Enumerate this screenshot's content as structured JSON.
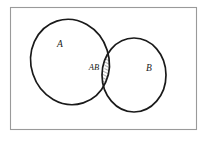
{
  "figure": {
    "name": "venn-diagram",
    "type": "venn-2-set",
    "background_color": "#ffffff",
    "frame": {
      "label": "universal-set-rectangle",
      "stroke_color": "#9a9a9a",
      "stroke_width": 1.1,
      "x": 10.5,
      "y": 7.5,
      "width": 186,
      "height": 122
    },
    "sets": [
      {
        "id": "A",
        "label": "A",
        "label_x": 60,
        "label_y": 47,
        "stroke_color": "#1a1a1a",
        "stroke_width": 1.7,
        "fill": "none",
        "cx": 70,
        "cy": 62,
        "rx": 39,
        "ry": 43,
        "rotation": -18
      },
      {
        "id": "B",
        "label": "B",
        "label_x": 149,
        "label_y": 71,
        "stroke_color": "#1a1a1a",
        "stroke_width": 1.7,
        "fill": "none",
        "cx": 134,
        "cy": 75,
        "rx": 32,
        "ry": 37,
        "rotation": 0
      }
    ],
    "intersection": {
      "id": "AB",
      "label": "AB",
      "label_x": 94,
      "label_y": 70,
      "fill_pattern": "diagonal-hatch",
      "hatch_color": "#1a1a1a",
      "hatch_angle_deg": -45,
      "hatch_spacing": 3,
      "hatch_line_width": 0.7,
      "label_clearing": "white-ellipse"
    },
    "label_font_size": 9.5,
    "intersection_label_font_size": 8.5
  }
}
